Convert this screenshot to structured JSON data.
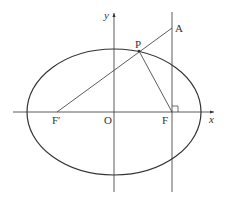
{
  "diagram": {
    "type": "ellipse-foci",
    "labels": {
      "y_axis": "y",
      "x_axis": "x",
      "origin": "O",
      "focus_left": "F′",
      "focus_right": "F",
      "point_p": "P",
      "point_a": "A"
    },
    "colors": {
      "stroke": "#333333",
      "background": "#ffffff"
    }
  }
}
